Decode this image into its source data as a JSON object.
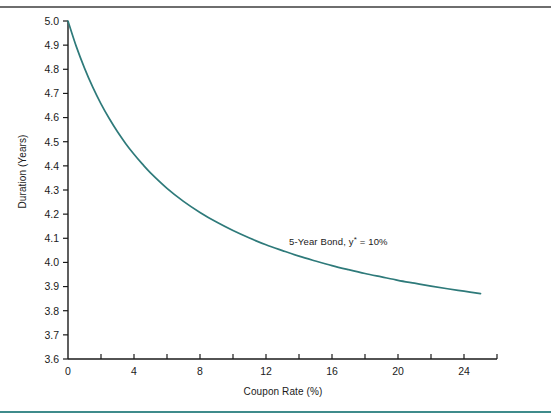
{
  "figure": {
    "top_rule_color": "#6e6e6e",
    "bottom_rule_color": "#3f8b8b",
    "background": "#ffffff"
  },
  "chart_data": {
    "type": "line",
    "title": "",
    "xlabel": "Coupon Rate (%)",
    "ylabel": "Duration (Years)",
    "xlim": [
      0,
      26
    ],
    "ylim": [
      3.6,
      5.0
    ],
    "grid": false,
    "legend_position": "none",
    "line_color": "#2e7a7a",
    "axis_color": "#1a1a1a",
    "x_major_ticks": [
      0,
      4,
      8,
      12,
      16,
      20,
      24
    ],
    "x_minor_ticks": [
      2,
      6,
      10,
      14,
      18,
      22,
      26
    ],
    "x_tick_labels": [
      "0",
      "4",
      "8",
      "12",
      "16",
      "20",
      "24"
    ],
    "y_ticks": [
      3.6,
      3.7,
      3.8,
      3.9,
      4.0,
      4.1,
      4.2,
      4.3,
      4.4,
      4.5,
      4.6,
      4.7,
      4.8,
      4.9,
      5.0
    ],
    "y_tick_labels": [
      "3.6",
      "3.7",
      "3.8",
      "3.9",
      "4.0",
      "4.1",
      "4.2",
      "4.3",
      "4.4",
      "4.5",
      "4.6",
      "4.7",
      "4.8",
      "4.9",
      "5.0"
    ],
    "series": [
      {
        "name": "5-Year Bond Duration",
        "x": [
          0,
          0.5,
          1,
          1.5,
          2,
          2.5,
          3,
          3.5,
          4,
          4.5,
          5,
          6,
          7,
          8,
          9,
          10,
          11,
          12,
          13,
          14,
          15,
          16,
          17,
          18,
          19,
          20,
          21,
          22,
          23,
          24,
          25
        ],
        "y": [
          5.0,
          4.895,
          4.805,
          4.726,
          4.657,
          4.596,
          4.541,
          4.492,
          4.448,
          4.408,
          4.371,
          4.307,
          4.253,
          4.207,
          4.167,
          4.132,
          4.101,
          4.073,
          4.049,
          4.026,
          4.006,
          3.987,
          3.97,
          3.954,
          3.94,
          3.926,
          3.914,
          3.902,
          3.891,
          3.881,
          3.871
        ]
      }
    ],
    "annotations": [
      {
        "text_prefix": "5-Year Bond, y",
        "text_superscript": "*",
        "text_suffix": " = 10%",
        "full_text": "5-Year Bond, y* = 10%",
        "x_data": 13.4,
        "y_data": 4.09
      }
    ]
  }
}
